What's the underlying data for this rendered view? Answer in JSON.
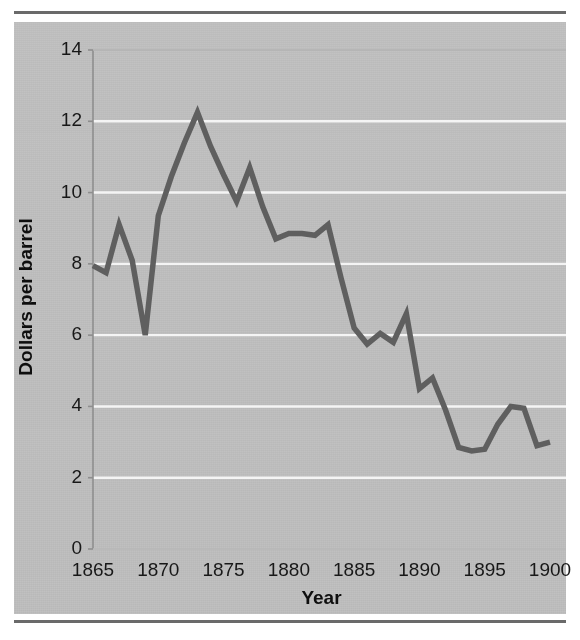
{
  "figure": {
    "background_color": "#c2c2c2",
    "page_color": "#ffffff",
    "rule_color": "#6a6a6a",
    "gridline_color": "#f4f4f4",
    "axis_color": "#8e8e8e",
    "line_color": "#5f5f5f",
    "text_color": "#181818"
  },
  "chart_data": {
    "type": "line",
    "title": "",
    "xlabel": "Year",
    "ylabel": "Dollars per barrel",
    "xlim": [
      1865,
      1900
    ],
    "ylim": [
      0,
      14
    ],
    "xticks": [
      1865,
      1870,
      1875,
      1880,
      1885,
      1890,
      1895,
      1900
    ],
    "xtick_labels": [
      "1865",
      "1870",
      "1875",
      "1880",
      "1885",
      "1890",
      "1895",
      "1900"
    ],
    "yticks": [
      0,
      2,
      4,
      6,
      8,
      10,
      12,
      14
    ],
    "ytick_labels": [
      "0",
      "2",
      "4",
      "6",
      "8",
      "10",
      "12",
      "14"
    ],
    "grid": "horizontal",
    "legend": "none",
    "series": [
      {
        "name": "Dollars per barrel",
        "x": [
          1865,
          1866,
          1867,
          1868,
          1869,
          1870,
          1871,
          1872,
          1873,
          1874,
          1875,
          1876,
          1877,
          1878,
          1879,
          1880,
          1881,
          1882,
          1883,
          1884,
          1885,
          1886,
          1887,
          1888,
          1889,
          1890,
          1891,
          1892,
          1893,
          1894,
          1895,
          1896,
          1897,
          1898,
          1899,
          1900
        ],
        "values": [
          7.95,
          7.75,
          9.1,
          8.1,
          6.0,
          9.35,
          10.45,
          11.4,
          12.25,
          11.3,
          10.5,
          9.75,
          10.7,
          9.6,
          8.7,
          8.85,
          8.85,
          8.8,
          9.1,
          7.6,
          6.2,
          5.75,
          6.05,
          5.8,
          6.6,
          4.5,
          4.8,
          3.9,
          2.85,
          2.75,
          2.8,
          3.5,
          4.0,
          3.95,
          2.9,
          3.0
        ]
      }
    ]
  }
}
